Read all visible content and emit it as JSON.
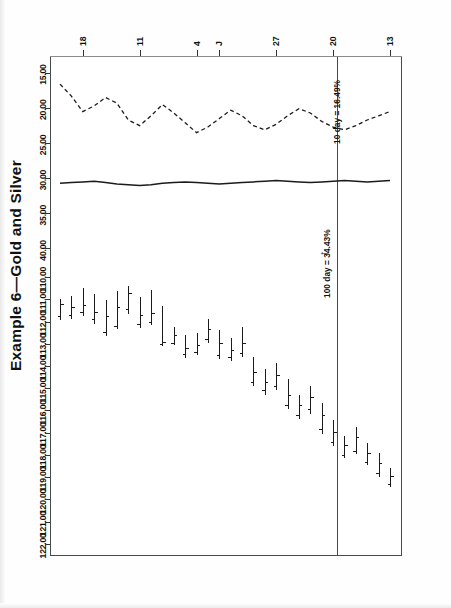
{
  "document": {
    "title": "Example 6—Gold and Silver",
    "orientation": "rotated-90-ccw"
  },
  "chart_data": {
    "type": "line",
    "subtype": "ohlc-bar-chart-with-stochastic-oscillator",
    "title": "Example 6—Gold and Silver",
    "xlabel": "",
    "ylabel": "",
    "grid": false,
    "legend_position": "none",
    "panes": [
      {
        "name": "price-pane",
        "ylim": [
          109.5,
          122.5
        ],
        "ytick_labels": [
          "122.00",
          "121.00",
          "120.00",
          "119.00",
          "118.00",
          "117.00",
          "116.00",
          "115.00",
          "114.00",
          "113.00",
          "112.00",
          "111.00",
          "110.00"
        ],
        "ytick_values": [
          122.0,
          121.0,
          120.0,
          119.0,
          118.0,
          117.0,
          116.0,
          115.0,
          114.0,
          113.0,
          112.0,
          111.0,
          110.0
        ]
      },
      {
        "name": "oscillator-pane",
        "ylim": [
          12.5,
          42.5
        ],
        "ytick_labels": [
          "40.00",
          "35.00",
          "30.00",
          "25.00",
          "20.00",
          "15.00"
        ],
        "ytick_values": [
          40.0,
          35.0,
          30.0,
          25.0,
          20.0,
          15.0
        ]
      }
    ],
    "xtick_labels": [
      "18",
      "11",
      "4",
      "J",
      "27",
      "20",
      "13"
    ],
    "xtick_positions": [
      2,
      7,
      12,
      14,
      19,
      24,
      29
    ],
    "ohlc": [
      {
        "i": 0,
        "high": 110.95,
        "low": 111.9,
        "open": 111.75,
        "close": 111.2
      },
      {
        "i": 1,
        "high": 110.8,
        "low": 111.85,
        "open": 111.7,
        "close": 111.35
      },
      {
        "i": 2,
        "high": 110.45,
        "low": 111.7,
        "open": 111.55,
        "close": 111.25
      },
      {
        "i": 3,
        "high": 110.7,
        "low": 112.05,
        "open": 111.9,
        "close": 111.55
      },
      {
        "i": 4,
        "high": 111.0,
        "low": 112.6,
        "open": 112.45,
        "close": 111.75
      },
      {
        "i": 5,
        "high": 110.6,
        "low": 112.3,
        "open": 112.2,
        "close": 111.35
      },
      {
        "i": 6,
        "high": 110.35,
        "low": 111.6,
        "open": 111.45,
        "close": 110.7
      },
      {
        "i": 7,
        "high": 110.85,
        "low": 112.25,
        "open": 112.1,
        "close": 111.7
      },
      {
        "i": 8,
        "high": 110.55,
        "low": 112.1,
        "open": 112.0,
        "close": 111.6
      },
      {
        "i": 9,
        "high": 111.25,
        "low": 113.05,
        "open": 113.0,
        "close": 112.9
      },
      {
        "i": 10,
        "high": 112.2,
        "low": 113.0,
        "open": 112.95,
        "close": 112.6
      },
      {
        "i": 11,
        "high": 112.55,
        "low": 113.6,
        "open": 113.45,
        "close": 113.2
      },
      {
        "i": 12,
        "high": 112.45,
        "low": 113.45,
        "open": 113.35,
        "close": 113.05
      },
      {
        "i": 13,
        "high": 111.85,
        "low": 112.9,
        "open": 112.8,
        "close": 112.35
      },
      {
        "i": 14,
        "high": 112.35,
        "low": 113.65,
        "open": 113.5,
        "close": 112.95
      },
      {
        "i": 15,
        "high": 112.7,
        "low": 113.75,
        "open": 113.6,
        "close": 113.3
      },
      {
        "i": 16,
        "high": 112.2,
        "low": 113.55,
        "open": 113.4,
        "close": 112.95
      },
      {
        "i": 17,
        "high": 113.55,
        "low": 114.85,
        "open": 114.7,
        "close": 114.25
      },
      {
        "i": 18,
        "high": 114.1,
        "low": 115.25,
        "open": 115.1,
        "close": 114.7
      },
      {
        "i": 19,
        "high": 113.8,
        "low": 115.05,
        "open": 114.9,
        "close": 114.4
      },
      {
        "i": 20,
        "high": 114.55,
        "low": 115.9,
        "open": 115.75,
        "close": 115.3
      },
      {
        "i": 21,
        "high": 115.25,
        "low": 116.35,
        "open": 116.2,
        "close": 115.75
      },
      {
        "i": 22,
        "high": 114.85,
        "low": 116.1,
        "open": 115.95,
        "close": 115.4
      },
      {
        "i": 23,
        "high": 115.6,
        "low": 117.0,
        "open": 116.85,
        "close": 116.2
      },
      {
        "i": 24,
        "high": 116.4,
        "low": 117.55,
        "open": 117.4,
        "close": 116.95
      },
      {
        "i": 25,
        "high": 117.1,
        "low": 118.1,
        "open": 118.0,
        "close": 117.55
      },
      {
        "i": 26,
        "high": 116.7,
        "low": 117.9,
        "open": 117.8,
        "close": 117.2
      },
      {
        "i": 27,
        "high": 117.4,
        "low": 118.4,
        "open": 118.3,
        "close": 117.9
      },
      {
        "i": 28,
        "high": 117.85,
        "low": 118.95,
        "open": 118.8,
        "close": 118.35
      },
      {
        "i": 29,
        "high": 118.55,
        "low": 119.4,
        "open": 119.3,
        "close": 118.95
      }
    ],
    "series": [
      {
        "name": "100 day",
        "style": "solid",
        "label": "100 day = 34.43%",
        "value": 34.43,
        "values": [
          30.6,
          30.5,
          30.4,
          30.3,
          30.5,
          30.7,
          30.8,
          30.9,
          30.8,
          30.6,
          30.5,
          30.4,
          30.5,
          30.6,
          30.7,
          30.6,
          30.5,
          30.4,
          30.3,
          30.2,
          30.3,
          30.4,
          30.5,
          30.4,
          30.3,
          30.2,
          30.3,
          30.4,
          30.3,
          30.2
        ]
      },
      {
        "name": "10 day",
        "style": "dashed",
        "label": "10 day = 16.49%",
        "value": 16.49,
        "values": [
          16.5,
          18.2,
          20.4,
          19.6,
          18.4,
          19.2,
          21.6,
          22.4,
          21.0,
          19.4,
          20.6,
          22.0,
          23.4,
          22.6,
          21.4,
          20.2,
          21.0,
          22.4,
          23.0,
          22.2,
          21.0,
          20.0,
          20.6,
          21.8,
          22.6,
          23.0,
          22.4,
          21.6,
          21.0,
          20.4
        ]
      }
    ],
    "annotations": [
      {
        "name": "annotation-100-day",
        "text": "100 day = 34.43%",
        "arrow": true
      },
      {
        "name": "annotation-10-day",
        "text": "10 day = 16.49%",
        "arrow": false
      },
      {
        "name": "bar-pointer",
        "text": "➜",
        "arrow": true
      }
    ]
  }
}
